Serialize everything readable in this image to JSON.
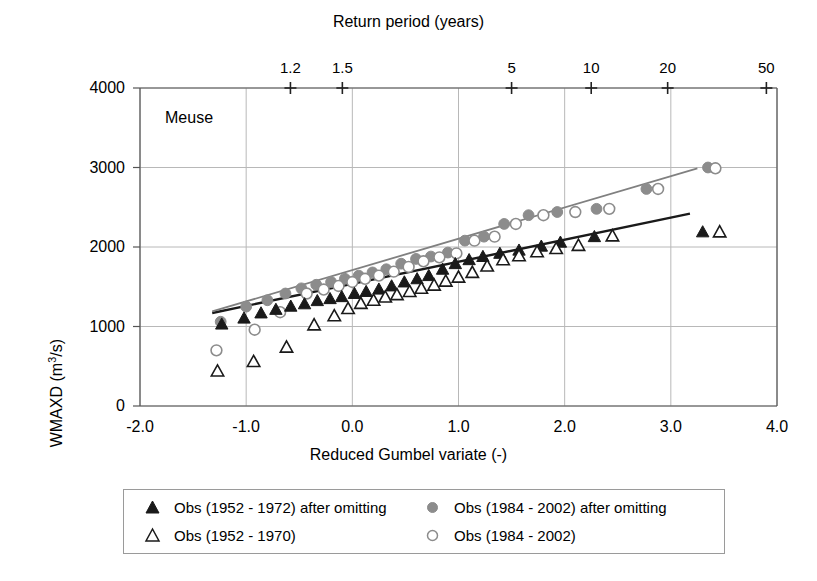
{
  "chart_data": {
    "type": "scatter",
    "title": "",
    "annotation": "Meuse",
    "xlabel": "Reduced Gumbel variate (-)",
    "ylabel": "WMAXD (m3/s)",
    "ylabel_prefix": "WMAXD (m",
    "ylabel_sup": "3",
    "ylabel_suffix": "/s)",
    "top_axis_label": "Return period (years)",
    "xlim": [
      -2.0,
      4.0
    ],
    "ylim": [
      0,
      4000
    ],
    "xticks": [
      "-2.0",
      "-1.0",
      "0.0",
      "1.0",
      "2.0",
      "3.0",
      "4.0"
    ],
    "xtick_values": [
      -2.0,
      -1.0,
      0.0,
      1.0,
      2.0,
      3.0,
      4.0
    ],
    "yticks": [
      "0",
      "1000",
      "2000",
      "3000",
      "4000"
    ],
    "ytick_values": [
      0,
      1000,
      2000,
      3000,
      4000
    ],
    "top_ticks": [
      "1.2",
      "1.5",
      "5",
      "10",
      "20",
      "50"
    ],
    "top_tick_values": [
      1.2,
      1.5,
      5,
      10,
      20,
      50
    ],
    "top_tick_x": [
      -0.583,
      -0.094,
      1.5,
      2.25,
      2.97,
      3.9
    ],
    "grid": true,
    "legend_position": "below",
    "series": [
      {
        "name": "Obs (1952 - 1972) after omitting",
        "marker": "filled-triangle",
        "color": "#1a1a1a",
        "points": [
          [
            -1.23,
            1030
          ],
          [
            -1.02,
            1105
          ],
          [
            -0.86,
            1170
          ],
          [
            -0.72,
            1215
          ],
          [
            -0.58,
            1255
          ],
          [
            -0.45,
            1285
          ],
          [
            -0.33,
            1325
          ],
          [
            -0.21,
            1350
          ],
          [
            -0.1,
            1375
          ],
          [
            0.02,
            1415
          ],
          [
            0.13,
            1440
          ],
          [
            0.25,
            1470
          ],
          [
            0.37,
            1510
          ],
          [
            0.49,
            1560
          ],
          [
            0.61,
            1600
          ],
          [
            0.72,
            1640
          ],
          [
            0.85,
            1720
          ],
          [
            0.97,
            1790
          ],
          [
            1.1,
            1840
          ],
          [
            1.23,
            1880
          ],
          [
            1.39,
            1920
          ],
          [
            1.57,
            1960
          ],
          [
            1.78,
            2010
          ],
          [
            1.96,
            2060
          ],
          [
            2.28,
            2130
          ],
          [
            3.3,
            2190
          ]
        ]
      },
      {
        "name": "Obs (1952 - 1970)",
        "marker": "open-triangle",
        "color": "#1a1a1a",
        "points": [
          [
            -1.27,
            440
          ],
          [
            -0.93,
            560
          ],
          [
            -0.62,
            740
          ],
          [
            -0.36,
            1020
          ],
          [
            -0.17,
            1135
          ],
          [
            -0.04,
            1225
          ],
          [
            0.08,
            1290
          ],
          [
            0.2,
            1330
          ],
          [
            0.31,
            1370
          ],
          [
            0.42,
            1400
          ],
          [
            0.54,
            1440
          ],
          [
            0.65,
            1480
          ],
          [
            0.77,
            1520
          ],
          [
            0.88,
            1570
          ],
          [
            1.0,
            1620
          ],
          [
            1.13,
            1680
          ],
          [
            1.27,
            1760
          ],
          [
            1.42,
            1840
          ],
          [
            1.57,
            1890
          ],
          [
            1.74,
            1940
          ],
          [
            1.92,
            1980
          ],
          [
            2.13,
            2020
          ],
          [
            2.45,
            2140
          ],
          [
            3.46,
            2190
          ]
        ]
      },
      {
        "name": "Obs (1984 - 2002) after omitting",
        "marker": "filled-circle",
        "color": "#8c8c8c",
        "points": [
          [
            -1.24,
            1060
          ],
          [
            -1.0,
            1250
          ],
          [
            -0.8,
            1330
          ],
          [
            -0.63,
            1415
          ],
          [
            -0.48,
            1480
          ],
          [
            -0.34,
            1525
          ],
          [
            -0.2,
            1560
          ],
          [
            -0.07,
            1600
          ],
          [
            0.06,
            1640
          ],
          [
            0.19,
            1680
          ],
          [
            0.32,
            1720
          ],
          [
            0.46,
            1790
          ],
          [
            0.6,
            1850
          ],
          [
            0.74,
            1880
          ],
          [
            0.9,
            1930
          ],
          [
            1.06,
            2080
          ],
          [
            1.24,
            2130
          ],
          [
            1.43,
            2290
          ],
          [
            1.66,
            2400
          ],
          [
            1.93,
            2440
          ],
          [
            2.3,
            2480
          ],
          [
            2.77,
            2730
          ],
          [
            3.35,
            3000
          ]
        ]
      },
      {
        "name": "Obs (1984 - 2002)",
        "marker": "open-circle",
        "color": "#8c8c8c",
        "points": [
          [
            -1.28,
            700
          ],
          [
            -0.92,
            960
          ],
          [
            -0.68,
            1180
          ],
          [
            -0.43,
            1415
          ],
          [
            -0.27,
            1465
          ],
          [
            -0.13,
            1510
          ],
          [
            0.0,
            1560
          ],
          [
            0.12,
            1600
          ],
          [
            0.25,
            1640
          ],
          [
            0.39,
            1690
          ],
          [
            0.53,
            1750
          ],
          [
            0.67,
            1820
          ],
          [
            0.82,
            1870
          ],
          [
            0.98,
            1920
          ],
          [
            1.15,
            2080
          ],
          [
            1.34,
            2130
          ],
          [
            1.54,
            2290
          ],
          [
            1.8,
            2400
          ],
          [
            2.1,
            2440
          ],
          [
            2.42,
            2480
          ],
          [
            2.88,
            2730
          ],
          [
            3.42,
            2990
          ]
        ]
      }
    ],
    "trendlines": [
      {
        "name": "trend-1952-1972",
        "color": "#1a1a1a",
        "x": [
          -1.32,
          3.18
        ],
        "y": [
          1170,
          2420
        ]
      },
      {
        "name": "trend-1984-2002",
        "color": "#808080",
        "x": [
          -1.32,
          3.25
        ],
        "y": [
          1190,
          2990
        ]
      }
    ]
  },
  "legend": {
    "entries": [
      {
        "label": "Obs (1952 - 1972) after omitting",
        "marker": "filled-triangle"
      },
      {
        "label": "Obs (1984 - 2002) after omitting",
        "marker": "filled-circle"
      },
      {
        "label": "Obs (1952 - 1970)",
        "marker": "open-triangle"
      },
      {
        "label": "Obs (1984 - 2002)",
        "marker": "open-circle"
      }
    ]
  },
  "colors": {
    "dark": "#1a1a1a",
    "gray": "#8c8c8c",
    "grid": "#b8b8b8",
    "axis": "#555555"
  }
}
